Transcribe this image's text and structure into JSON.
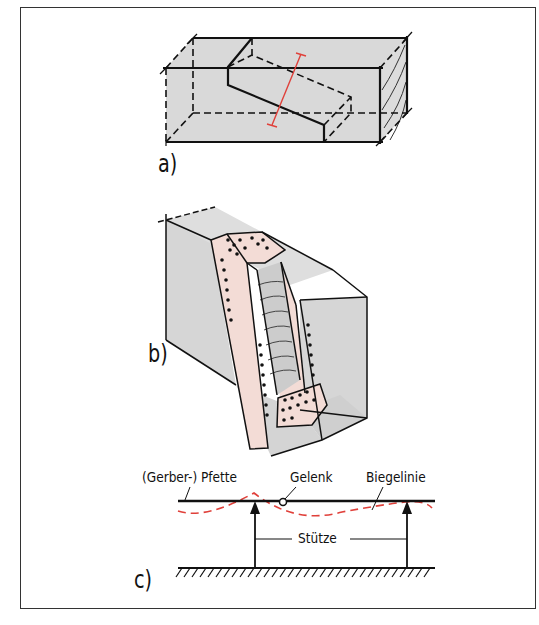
{
  "figure": {
    "panels": [
      {
        "id": "a",
        "label": "a)",
        "description": "Rectangular timber beam with diagonal scarf joint (Gerber joint), red dimension line across joint"
      },
      {
        "id": "b",
        "label": "b)",
        "description": "Isometric view of beam with cut-out slot, pink bearing faces with dot pattern and hatched wood grain inside"
      },
      {
        "id": "c",
        "label": "c)",
        "description": "Structural schematic of Gerber purlin with hinge, supports and deflection curve"
      }
    ],
    "annotations": {
      "pfette": "(Gerber-) Pfette",
      "gelenk": "Gelenk",
      "biegelinie": "Biegelinie",
      "stuetze": "Stütze"
    },
    "colors": {
      "beam_fill": "#d9d9d9",
      "joint_fill": "#f3dcd6",
      "deflection_line": "#e0403a",
      "dimension_line": "#e0403a",
      "outline": "#111111"
    }
  }
}
